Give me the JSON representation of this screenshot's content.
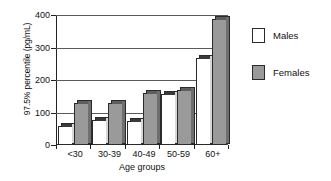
{
  "chart_data": {
    "type": "bar",
    "title": "",
    "subtitle": "",
    "xlabel": "Age groups",
    "ylabel": "97.5% percentile (pg/mL)",
    "categories": [
      "<30",
      "30-39",
      "40-49",
      "50-59",
      "60+"
    ],
    "series": [
      {
        "name": "Males",
        "color": "#ffffff",
        "values": [
          58,
          77,
          73,
          158,
          268
        ]
      },
      {
        "name": "Females",
        "color": "#9a9a9a",
        "values": [
          130,
          128,
          160,
          170,
          388
        ]
      }
    ],
    "ylim": [
      0,
      400
    ],
    "yticks": [
      0,
      100,
      200,
      300,
      400
    ],
    "ytick_labels": [
      "0",
      "100",
      "200",
      "300",
      "400"
    ],
    "grid": true,
    "legend_position": "right",
    "style": "3d-grouped-bar"
  },
  "legend": {
    "entries": [
      {
        "label": "Males"
      },
      {
        "label": "Females"
      }
    ]
  }
}
